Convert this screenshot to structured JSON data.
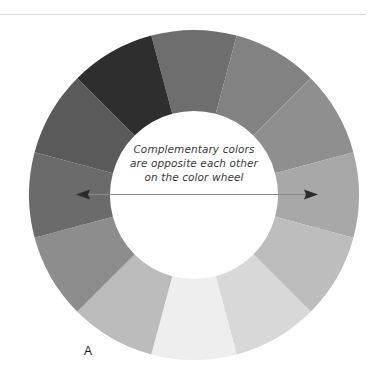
{
  "figure": {
    "panel_label": "A",
    "caption_lines": [
      "Complementary colors",
      "are opposite each other",
      "on the color wheel"
    ],
    "rule_color": "#d7d7d7",
    "background_color": "#ffffff"
  },
  "arrow": {
    "name": "complementary-axis-arrow",
    "color": "#2b2b2b",
    "line_color": "#8a8a8a",
    "x1": 78,
    "y1": 194,
    "x2": 316,
    "y2": 194,
    "double_headed": true
  },
  "chart_data": {
    "type": "pie",
    "title": "Complementary colors are opposite each other on the color wheel",
    "subtype": "donut-color-wheel",
    "center": [
      194,
      195
    ],
    "outer_radius": 165,
    "inner_radius": 84,
    "segment_count": 12,
    "segment_degrees": 30,
    "start_angle_deg": -105,
    "grid": false,
    "legend": "none",
    "categories": [
      "segment-1",
      "segment-2",
      "segment-3",
      "segment-4",
      "segment-5",
      "segment-6",
      "segment-7",
      "segment-8",
      "segment-9",
      "segment-10",
      "segment-11",
      "segment-12"
    ],
    "values": [
      30,
      30,
      30,
      30,
      30,
      30,
      30,
      30,
      30,
      30,
      30,
      30
    ],
    "colors": [
      "#6e6e6e",
      "#828282",
      "#8f8f8f",
      "#a8a8a8",
      "#bdbdbd",
      "#d8d8d8",
      "#eeeeee",
      "#bcbcbc",
      "#8d8d8d",
      "#6b6b6b",
      "#5a5a5a",
      "#2e2e2e"
    ],
    "extra_colors": {
      "dark_upper_left": "#262626",
      "mid_upper_left": "#7f7f7f"
    }
  }
}
